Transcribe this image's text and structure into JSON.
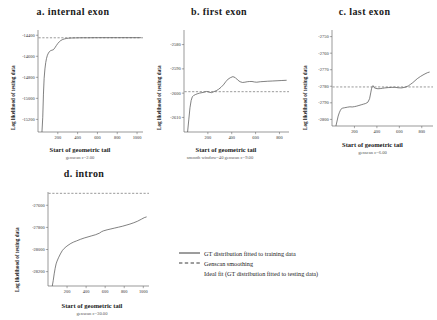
{
  "figure": {
    "shared_xlabel": "Start of geometric tail",
    "shared_ylabel": "Log likelihood of testing data"
  },
  "legend": {
    "position": "bottom-center",
    "items": [
      {
        "label": "GT distribution fitted to training data",
        "key": "solid-line"
      },
      {
        "label": "Genscan smoothing",
        "key": "dashed-line"
      },
      {
        "label": "Ideal fit (GT distribution fitted to testing data)",
        "key": "none"
      }
    ]
  },
  "chart_data": [
    {
      "type": "line",
      "panel": "a",
      "title": "a. internal exon",
      "subcaption": "genscan c=2.00",
      "xlabel": "Start of geometric tail",
      "ylabel": "Log likelihood of testing data",
      "xlim": [
        0,
        1060
      ],
      "ylim": [
        -15320,
        -14350
      ],
      "xticks": [
        200,
        400,
        600,
        800,
        1000
      ],
      "yticks": [
        -14400,
        -14600,
        -14800,
        -15000,
        -15200
      ],
      "grid": false,
      "series": [
        {
          "name": "GT distribution fitted to training data",
          "style": "solid",
          "x": [
            40,
            48,
            55,
            62,
            70,
            78,
            86,
            95,
            105,
            115,
            125,
            140,
            155,
            170,
            185,
            200,
            215,
            230,
            250,
            270,
            290,
            310,
            340,
            380,
            430,
            500,
            600,
            700,
            800,
            900,
            1000,
            1040
          ],
          "y": [
            -15320,
            -15180,
            -14960,
            -14810,
            -14720,
            -14660,
            -14620,
            -14590,
            -14570,
            -14556,
            -14548,
            -14542,
            -14538,
            -14520,
            -14498,
            -14478,
            -14462,
            -14450,
            -14440,
            -14434,
            -14430,
            -14428,
            -14426,
            -14425,
            -14424,
            -14424,
            -14423,
            -14423,
            -14423,
            -14423,
            -14423,
            -14423
          ]
        },
        {
          "name": "Genscan smoothing",
          "style": "dashed",
          "level": -14424
        }
      ]
    },
    {
      "type": "line",
      "panel": "b",
      "title": "b. first exon",
      "subcaption": "smooth window=40 genscan c=9.00",
      "xlabel": "Start of geometric tail",
      "ylabel": "Log likelihood of testing data",
      "xlim": [
        0,
        880
      ],
      "ylim": [
        -2616,
        -2574
      ],
      "xticks": [
        200,
        400,
        600,
        800
      ],
      "yticks": [
        -2580,
        -2590,
        -2600,
        -2610
      ],
      "grid": false,
      "series": [
        {
          "name": "GT distribution fitted to training data",
          "style": "solid",
          "x": [
            30,
            40,
            50,
            60,
            70,
            80,
            95,
            110,
            130,
            150,
            170,
            190,
            210,
            230,
            250,
            270,
            290,
            310,
            330,
            350,
            370,
            390,
            410,
            430,
            450,
            470,
            490,
            510,
            530,
            550,
            570,
            590,
            610,
            640,
            670,
            700,
            740,
            780,
            820,
            860
          ],
          "y": [
            -2616,
            -2611,
            -2606,
            -2603,
            -2601.5,
            -2601,
            -2600.6,
            -2600.3,
            -2600.0,
            -2599.8,
            -2599.6,
            -2599.3,
            -2599.6,
            -2599.8,
            -2599.4,
            -2599.0,
            -2598.4,
            -2597.6,
            -2596.6,
            -2595.3,
            -2594.2,
            -2593.6,
            -2593.2,
            -2593.6,
            -2594.6,
            -2595.3,
            -2595.6,
            -2595.5,
            -2595.3,
            -2595.2,
            -2595.2,
            -2595.4,
            -2595.5,
            -2595.3,
            -2595.2,
            -2595.1,
            -2595.0,
            -2594.9,
            -2594.8,
            -2594.7
          ]
        },
        {
          "name": "Genscan smoothing",
          "style": "dashed",
          "level": -2599.4
        }
      ]
    },
    {
      "type": "line",
      "panel": "c",
      "title": "c. last exon",
      "subcaption": "genscan c=6.00",
      "xlabel": "Start of geometric tail",
      "ylabel": "Log likelihood of testing data",
      "xlim": [
        0,
        900
      ],
      "ylim": [
        -2804,
        -2746
      ],
      "xticks": [
        200,
        400,
        600,
        800
      ],
      "yticks": [
        -2750,
        -2760,
        -2770,
        -2780,
        -2790,
        -2800
      ],
      "grid": false,
      "series": [
        {
          "name": "GT distribution fitted to training data",
          "style": "solid",
          "x": [
            35,
            45,
            55,
            65,
            75,
            85,
            95,
            110,
            125,
            140,
            160,
            180,
            200,
            220,
            240,
            260,
            280,
            300,
            320,
            335,
            345,
            352,
            358,
            365,
            375,
            390,
            410,
            430,
            450,
            470,
            500,
            530,
            560,
            590,
            620,
            650,
            680,
            700,
            720,
            740,
            760,
            790,
            820,
            850,
            870
          ],
          "y": [
            -2804,
            -2801,
            -2798,
            -2796,
            -2794.5,
            -2793.5,
            -2793.2,
            -2793.0,
            -2792.8,
            -2792.6,
            -2792.4,
            -2792.5,
            -2792.3,
            -2792.0,
            -2791.6,
            -2791.2,
            -2790.8,
            -2790.4,
            -2789.6,
            -2787.5,
            -2784.0,
            -2781.5,
            -2780.2,
            -2779.6,
            -2780.8,
            -2781.3,
            -2781.5,
            -2781.4,
            -2781.2,
            -2781.0,
            -2780.8,
            -2780.7,
            -2780.6,
            -2780.9,
            -2781.0,
            -2780.6,
            -2779.8,
            -2778.8,
            -2777.8,
            -2776.6,
            -2775.4,
            -2774.0,
            -2772.8,
            -2771.8,
            -2771.4
          ]
        },
        {
          "name": "Genscan smoothing",
          "style": "dashed",
          "level": -2780.4
        }
      ]
    },
    {
      "type": "line",
      "panel": "d",
      "title": "d. intron",
      "subcaption": "genscan c=30.00",
      "xlabel": "Start of geometric tail",
      "ylabel": "Log likelihood of testing data",
      "xlim": [
        0,
        1060
      ],
      "ylim": [
        -28330,
        -27480
      ],
      "xticks": [
        200,
        400,
        600,
        800,
        1000
      ],
      "yticks": [
        -27600,
        -27800,
        -28000,
        -28200
      ],
      "grid": false,
      "series": [
        {
          "name": "GT distribution fitted to training data",
          "style": "solid",
          "x": [
            45,
            55,
            65,
            75,
            85,
            95,
            110,
            130,
            150,
            170,
            190,
            210,
            240,
            270,
            300,
            340,
            380,
            420,
            460,
            500,
            540,
            560,
            580,
            620,
            660,
            700,
            740,
            780,
            820,
            860,
            900,
            940,
            980,
            1010,
            1035
          ],
          "y": [
            -28330,
            -28280,
            -28220,
            -28170,
            -28130,
            -28105,
            -28075,
            -28040,
            -28010,
            -27990,
            -27975,
            -27962,
            -27945,
            -27932,
            -27922,
            -27908,
            -27896,
            -27886,
            -27876,
            -27866,
            -27852,
            -27840,
            -27832,
            -27822,
            -27814,
            -27806,
            -27798,
            -27790,
            -27780,
            -27770,
            -27758,
            -27744,
            -27726,
            -27712,
            -27705
          ]
        },
        {
          "name": "Genscan smoothing",
          "style": "dashed",
          "level": -27492
        }
      ]
    }
  ]
}
